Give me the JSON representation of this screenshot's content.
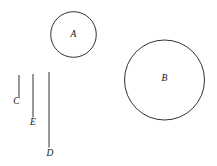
{
  "figure": {
    "background_color": "#ffffff",
    "stroke_color": "#1a1a1a",
    "label_color": "#111111",
    "width": 217,
    "height": 166,
    "circles": [
      {
        "id": "circle-a",
        "label": "A",
        "cx": 73.5,
        "cy": 34.5,
        "r": 22.8,
        "label_x": 73.5,
        "label_y": 34.5
      },
      {
        "id": "circle-b",
        "label": "B",
        "cx": 164.5,
        "cy": 80.0,
        "r": 40.0,
        "label_x": 164.5,
        "label_y": 79.0
      }
    ],
    "segments": [
      {
        "id": "segment-c",
        "label": "C",
        "x": 19.0,
        "y1": 75.0,
        "y2": 97.0,
        "label_x": 16.5,
        "label_y": 101.5
      },
      {
        "id": "segment-e",
        "label": "E",
        "x": 33.0,
        "y1": 74.0,
        "y2": 117.5,
        "label_x": 33.0,
        "label_y": 123.0
      },
      {
        "id": "segment-d",
        "label": "D",
        "x": 49.0,
        "y1": 72.0,
        "y2": 147.5,
        "label_x": 50.0,
        "label_y": 153.5
      }
    ]
  }
}
